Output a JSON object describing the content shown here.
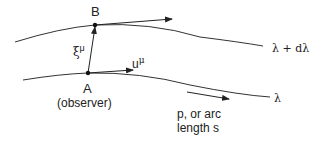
{
  "diagram": {
    "point_a": {
      "label": "A",
      "sublabel": "(observer)"
    },
    "point_b": {
      "label": "B"
    },
    "separation_vector": {
      "symbol": "ξ",
      "index": "μ"
    },
    "velocity_vector": {
      "symbol": "u",
      "index": "μ"
    },
    "curves": {
      "upper": "λ + dλ",
      "lower": "λ"
    },
    "parameter_label_line1": "p, or arc",
    "parameter_label_line2": "length s"
  }
}
